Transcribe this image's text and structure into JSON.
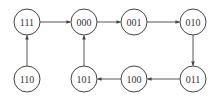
{
  "diagram": {
    "type": "state-transition",
    "nodes": [
      {
        "id": "111",
        "label": "111",
        "x": 27,
        "y": 22
      },
      {
        "id": "000",
        "label": "000",
        "x": 84,
        "y": 22
      },
      {
        "id": "001",
        "label": "001",
        "x": 134,
        "y": 22
      },
      {
        "id": "010",
        "label": "010",
        "x": 193,
        "y": 22
      },
      {
        "id": "110",
        "label": "110",
        "x": 27,
        "y": 79
      },
      {
        "id": "101",
        "label": "101",
        "x": 84,
        "y": 79
      },
      {
        "id": "100",
        "label": "100",
        "x": 134,
        "y": 79
      },
      {
        "id": "011",
        "label": "011",
        "x": 193,
        "y": 79
      }
    ],
    "edges": [
      {
        "from": "111",
        "to": "000"
      },
      {
        "from": "000",
        "to": "001"
      },
      {
        "from": "001",
        "to": "010"
      },
      {
        "from": "010",
        "to": "011"
      },
      {
        "from": "011",
        "to": "100"
      },
      {
        "from": "100",
        "to": "101"
      },
      {
        "from": "101",
        "to": "000"
      },
      {
        "from": "110",
        "to": "111"
      }
    ],
    "node_radius": 13,
    "stroke_color": "#444444"
  }
}
